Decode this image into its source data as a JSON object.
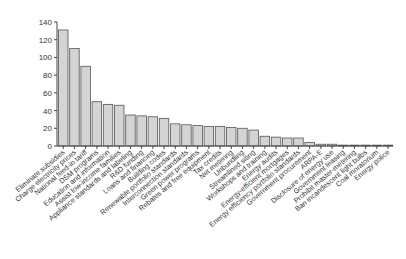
{
  "chart_data": {
    "type": "bar",
    "title": "",
    "xlabel": "",
    "ylabel": "",
    "ylim": [
      0,
      140
    ],
    "yticks": [
      0,
      20,
      40,
      60,
      80,
      100,
      120,
      140
    ],
    "grid": false,
    "legend": null,
    "bar_color": "#d4d4d4",
    "bar_edge_color": "#555555",
    "categories": [
      "Eliminate subsidies",
      "Charge electricity prices",
      "National feed-in tariff",
      "DSM programs",
      "Education and information",
      "Assist low-income families",
      "Appliance standards and labeling",
      "R&D funding",
      "Loans and financing",
      "Building codes",
      "Renewable portfolio standards",
      "Interconnection standards",
      "Green power programs",
      "Rebates and free equipment",
      "Tax credits",
      "Net metering",
      "Unbundling",
      "Streamlined siting",
      "Workshops and training",
      "Energy audits",
      "Energy-efficient mortgages",
      "Energy efficiency portfolio standards",
      "Government procurement",
      "ARPA-E",
      "Disclosure of energy use",
      "Government leasing",
      "Prohibit master-metering",
      "Ban incandescent light bulbs",
      "Coal moratorium",
      "Energy police"
    ],
    "values": [
      131,
      110,
      90,
      50,
      47,
      46,
      35,
      34,
      33,
      31,
      25,
      24,
      23,
      22,
      22,
      21,
      20,
      18,
      11,
      10,
      9,
      9,
      4,
      2,
      2,
      1,
      1,
      1,
      1,
      1
    ]
  }
}
